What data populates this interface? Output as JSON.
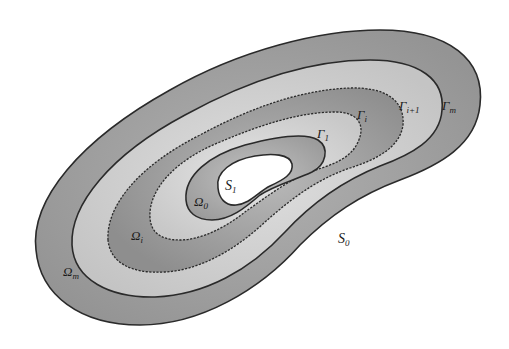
{
  "figure": {
    "colors": {
      "background": "#ffffff",
      "band_dark": "#9a9a9a",
      "band_light": "#cfcfcf",
      "band_mid": "#a8a8a8",
      "hole": "#ffffff",
      "line": "#2a2a2a"
    },
    "boundaries": [
      {
        "name": "S0",
        "style": "solid",
        "role": "outer boundary"
      },
      {
        "name": "Γm",
        "style": "solid"
      },
      {
        "name": "Γi+1",
        "style": "dashed"
      },
      {
        "name": "Γi",
        "style": "dashed"
      },
      {
        "name": "Γ1",
        "style": "solid"
      },
      {
        "name": "S1",
        "style": "solid",
        "role": "inner boundary (hole)"
      }
    ],
    "regions": [
      "Ωm",
      "Ωi",
      "Ω0"
    ]
  },
  "labels": {
    "S1": {
      "main": "S",
      "sub": "1"
    },
    "S0": {
      "main": "S",
      "sub": "0"
    },
    "Omega0": {
      "main": "Ω",
      "sub": "0"
    },
    "Omegai": {
      "main": "Ω",
      "sub": "i"
    },
    "Omegam": {
      "main": "Ω",
      "sub": "m"
    },
    "Gamma1": {
      "main": "Γ",
      "sub": "1"
    },
    "Gammai": {
      "main": "Γ",
      "sub": "i"
    },
    "Gammai1": {
      "main": "Γ",
      "sub": "i+1"
    },
    "Gammam": {
      "main": "Γ",
      "sub": "m"
    }
  }
}
